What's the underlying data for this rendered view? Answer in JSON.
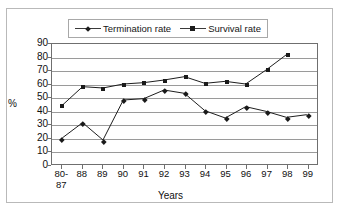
{
  "chart_data": {
    "type": "line",
    "title": "",
    "xlabel": "Years",
    "ylabel": "%",
    "ylim": [
      0,
      90
    ],
    "ytick_step": 10,
    "yticks": [
      90,
      80,
      70,
      60,
      50,
      40,
      30,
      20,
      10,
      0
    ],
    "grid": true,
    "legend_position": "top-center",
    "categories": [
      "80-\n87",
      "88",
      "89",
      "90",
      "91",
      "92",
      "93",
      "94",
      "95",
      "96",
      "97",
      "98",
      "99"
    ],
    "categories_plain": [
      "80-87",
      "88",
      "89",
      "90",
      "91",
      "92",
      "93",
      "94",
      "95",
      "96",
      "97",
      "98",
      "99"
    ],
    "series": [
      {
        "name": "Termination rate",
        "marker": "diamond",
        "color": "#1a1a1a",
        "values": [
          19.5,
          31,
          18,
          48,
          49,
          55.5,
          53,
          40,
          34.5,
          43,
          39.5,
          35,
          37
        ]
      },
      {
        "name": "Survival rate",
        "marker": "square",
        "color": "#1a1a1a",
        "values": [
          44,
          58,
          57,
          60,
          61,
          63,
          65.5,
          60.5,
          62,
          60,
          70.5,
          82,
          null
        ]
      }
    ]
  },
  "legend": {
    "entries": [
      {
        "label": "Termination rate",
        "marker": "diamond"
      },
      {
        "label": "Survival rate",
        "marker": "square"
      }
    ]
  },
  "colors": {
    "line": "#1a1a1a",
    "grid": "#9a9a9a",
    "axis": "#6f6f6f",
    "frame": "#b9b9b9",
    "text": "#101010",
    "background": "#ffffff"
  }
}
